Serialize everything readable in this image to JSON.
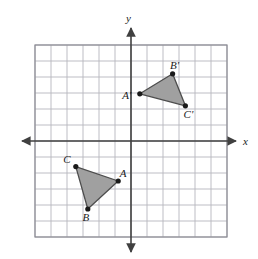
{
  "figure": {
    "background_color": "#ffffff"
  },
  "chart_data": {
    "type": "scatter",
    "title": "",
    "xlabel": "x",
    "ylabel": "y",
    "xlim": [
      -6,
      6
    ],
    "ylim": [
      -6,
      6
    ],
    "grid": true,
    "grid_spacing": 1,
    "legend": "none",
    "series": [
      {
        "name": "Triangle ABC",
        "closed": true,
        "fill": "#a0a0a0",
        "stroke": "#4d4d4d",
        "points": [
          {
            "label": "A",
            "x": -0.8,
            "y": -2.5,
            "label_dx": 5,
            "label_dy": -4
          },
          {
            "label": "B",
            "x": -2.7,
            "y": -4.25,
            "label_dx": -2,
            "label_dy": 12
          },
          {
            "label": "C",
            "x": -3.45,
            "y": -1.6,
            "label_dx": -9,
            "label_dy": -4
          }
        ]
      },
      {
        "name": "Triangle A'B'C'",
        "closed": true,
        "fill": "#a0a0a0",
        "stroke": "#4d4d4d",
        "points": [
          {
            "label": "A'",
            "x": 0.55,
            "y": 2.95,
            "label_dx": -13,
            "label_dy": 5
          },
          {
            "label": "B'",
            "x": 2.6,
            "y": 4.2,
            "label_dx": 2,
            "label_dy": -5
          },
          {
            "label": "C'",
            "x": 3.4,
            "y": 2.2,
            "label_dx": 3,
            "label_dy": 12
          }
        ]
      }
    ]
  },
  "axes": {
    "x_axis_label": "x",
    "y_axis_label": "y",
    "axis_color": "#404040",
    "grid_color": "#b5b5bd",
    "grid_border_color": "#8c8c94"
  }
}
